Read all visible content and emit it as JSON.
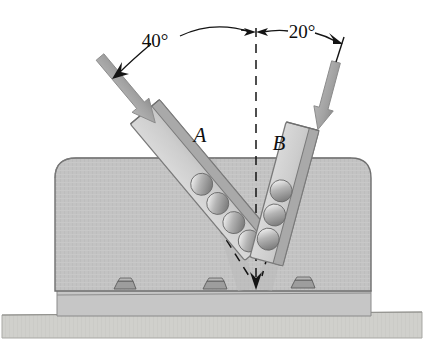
{
  "figure": {
    "background_color": "#ffffff"
  },
  "annotations": {
    "angle_left": "40°",
    "angle_right": "20°",
    "label_chute_a": "A",
    "label_chute_b": "B"
  },
  "geometry": {
    "vertex": {
      "x": 256,
      "y": 288
    },
    "centerline": {
      "x": 256,
      "y_top": 28,
      "y_bottom": 288
    },
    "chute_a": {
      "angle_deg": 40,
      "spheres": 4
    },
    "chute_b": {
      "angle_deg": 20,
      "spheres": 3
    },
    "bolts": 3
  },
  "colors": {
    "body_fill": "#c2c2c2",
    "body_stroke": "#6e6e6e",
    "base_plate_fill": "#c8c8c8",
    "ground_fill": "#cfcfcb",
    "chute_fill": "#cfcfcf",
    "chute_edge": "#9a9a9a",
    "chute_stroke": "#7a7a7a",
    "sphere_fill": "#a8a8a8",
    "sphere_highlight": "#e2e2e2",
    "arrow_fill": "#a6a6a6",
    "arrow_stroke": "#8a8a8a",
    "line_color": "#141414",
    "bolt_fill": "#9d9d9d",
    "bolt_stroke": "#5c5c5c"
  }
}
